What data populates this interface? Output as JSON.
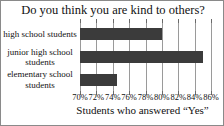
{
  "chart_data": {
    "type": "bar",
    "orientation": "horizontal",
    "title": "Do you think you are kind to others?",
    "xlabel": "Students who answered “Yes”",
    "ylabel": "",
    "categories": [
      "high school students",
      "junior high school students",
      "elementary school students"
    ],
    "values": [
      80.0,
      85.0,
      74.5
    ],
    "value_unit": "%",
    "xlim": [
      70,
      86
    ],
    "xticks": [
      70,
      72,
      74,
      76,
      78,
      80,
      82,
      84,
      86
    ],
    "xtick_labels": [
      "70%",
      "72%",
      "74%",
      "76%",
      "78%",
      "80%",
      "82%",
      "84%",
      "86%"
    ],
    "grid": true,
    "legend": false,
    "bar_color": "#3b3b3b",
    "grid_color": "#9a9a9a",
    "background_color": "#ffffff",
    "border_color": "#8a8a8a"
  }
}
